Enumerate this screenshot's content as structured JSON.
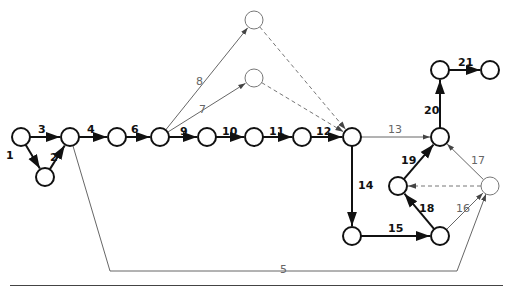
{
  "diagram": {
    "type": "activity-on-arrow network",
    "nodes": [
      {
        "id": "A",
        "x": 21,
        "y": 137,
        "style": "bold"
      },
      {
        "id": "B",
        "x": 45,
        "y": 177,
        "style": "bold"
      },
      {
        "id": "C",
        "x": 70,
        "y": 137,
        "style": "bold"
      },
      {
        "id": "D",
        "x": 117,
        "y": 137,
        "style": "bold"
      },
      {
        "id": "E",
        "x": 160,
        "y": 137,
        "style": "bold"
      },
      {
        "id": "F",
        "x": 207,
        "y": 137,
        "style": "bold"
      },
      {
        "id": "G",
        "x": 254,
        "y": 137,
        "style": "bold"
      },
      {
        "id": "H",
        "x": 302,
        "y": 137,
        "style": "bold"
      },
      {
        "id": "I",
        "x": 352,
        "y": 137,
        "style": "bold"
      },
      {
        "id": "T1",
        "x": 254,
        "y": 20,
        "style": "light"
      },
      {
        "id": "T2",
        "x": 254,
        "y": 78,
        "style": "light"
      },
      {
        "id": "J",
        "x": 440,
        "y": 137,
        "style": "bold"
      },
      {
        "id": "K",
        "x": 440,
        "y": 70,
        "style": "bold"
      },
      {
        "id": "L",
        "x": 490,
        "y": 70,
        "style": "bold"
      },
      {
        "id": "M",
        "x": 398,
        "y": 186,
        "style": "bold"
      },
      {
        "id": "N",
        "x": 490,
        "y": 186,
        "style": "light"
      },
      {
        "id": "O",
        "x": 352,
        "y": 236,
        "style": "bold"
      },
      {
        "id": "P",
        "x": 440,
        "y": 236,
        "style": "bold"
      }
    ],
    "edges": [
      {
        "label": "1",
        "from": "A",
        "to": "B",
        "style": "bold",
        "lx": 6,
        "ly": 150
      },
      {
        "label": "2",
        "from": "B",
        "to": "C",
        "style": "bold",
        "lx": 50,
        "ly": 152
      },
      {
        "label": "3",
        "from": "A",
        "to": "C",
        "style": "bold",
        "lx": 38,
        "ly": 124
      },
      {
        "label": "4",
        "from": "C",
        "to": "D",
        "style": "bold",
        "lx": 87,
        "ly": 124
      },
      {
        "label": "6",
        "from": "D",
        "to": "E",
        "style": "bold",
        "lx": 131,
        "ly": 124
      },
      {
        "label": "9",
        "from": "E",
        "to": "F",
        "style": "bold",
        "lx": 180,
        "ly": 126
      },
      {
        "label": "10",
        "from": "F",
        "to": "G",
        "style": "bold",
        "lx": 222,
        "ly": 126
      },
      {
        "label": "11",
        "from": "G",
        "to": "H",
        "style": "bold",
        "lx": 269,
        "ly": 126
      },
      {
        "label": "12",
        "from": "H",
        "to": "I",
        "style": "bold",
        "lx": 316,
        "ly": 126
      },
      {
        "label": "8",
        "from": "E",
        "to": "T1",
        "style": "thin",
        "lx": 196,
        "ly": 76
      },
      {
        "label": "7",
        "from": "E",
        "to": "T2",
        "style": "thin",
        "lx": 199,
        "ly": 104
      },
      {
        "label": "",
        "from": "T1",
        "to": "I",
        "style": "dashed",
        "lx": 0,
        "ly": 0
      },
      {
        "label": "",
        "from": "T2",
        "to": "I",
        "style": "dashed",
        "lx": 0,
        "ly": 0
      },
      {
        "label": "13",
        "from": "I",
        "to": "J",
        "style": "thin",
        "lx": 388,
        "ly": 124
      },
      {
        "label": "14",
        "from": "I",
        "to": "O",
        "style": "bold",
        "lx": 358,
        "ly": 180
      },
      {
        "label": "15",
        "from": "O",
        "to": "P",
        "style": "bold",
        "lx": 388,
        "ly": 223
      },
      {
        "label": "16",
        "from": "P",
        "to": "N",
        "style": "thin",
        "lx": 456,
        "ly": 203
      },
      {
        "label": "17",
        "from": "N",
        "to": "J",
        "style": "thin",
        "lx": 471,
        "ly": 155
      },
      {
        "label": "18",
        "from": "P",
        "to": "M",
        "style": "bold",
        "lx": 419,
        "ly": 203
      },
      {
        "label": "19",
        "from": "M",
        "to": "J",
        "style": "bold",
        "lx": 401,
        "ly": 155
      },
      {
        "label": "",
        "from": "N",
        "to": "M",
        "style": "dashed",
        "lx": 0,
        "ly": 0
      },
      {
        "label": "20",
        "from": "J",
        "to": "K",
        "style": "bold",
        "lx": 424,
        "ly": 105
      },
      {
        "label": "21",
        "from": "K",
        "to": "L",
        "style": "bold",
        "lx": 458,
        "ly": 57
      },
      {
        "label": "5",
        "from": "C",
        "to": "N",
        "style": "thin",
        "path": "C-bottom-polyline",
        "lx": 280,
        "ly": 264
      }
    ]
  }
}
